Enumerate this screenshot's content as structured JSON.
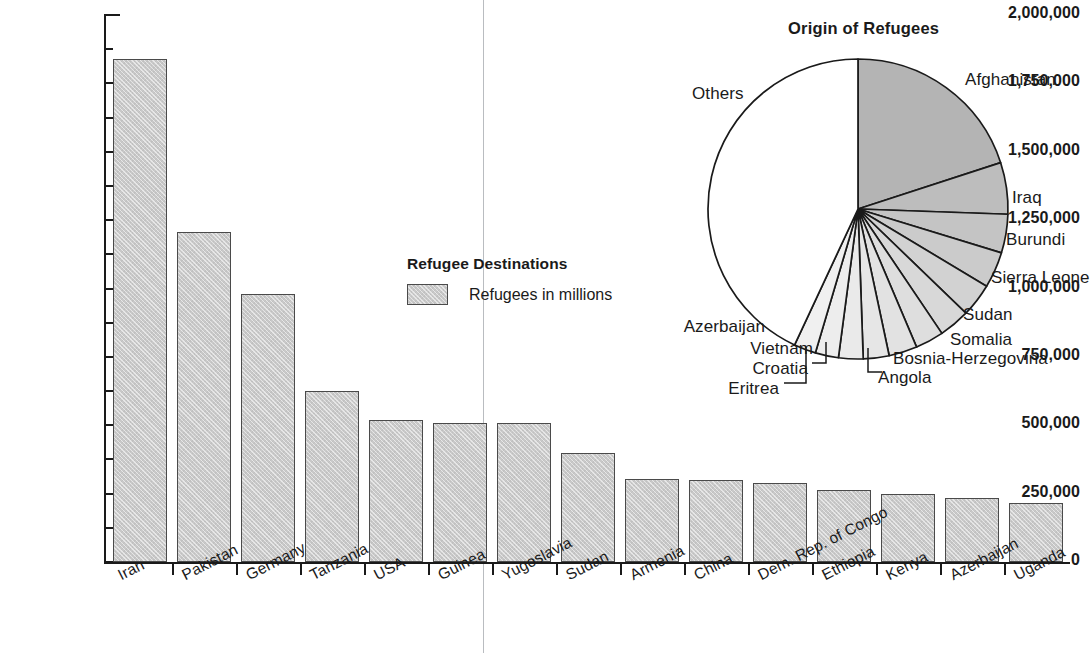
{
  "chart_data": [
    {
      "type": "bar",
      "title": "Refugee Destinations",
      "legend_title": "Refugee Destinations",
      "legend_entry": "Refugees in millions",
      "legend_position": "center",
      "xlabel": "",
      "ylabel": "",
      "ylim": [
        0,
        2000000
      ],
      "ytick_step": 250000,
      "grid": false,
      "orientation": "vertical",
      "categories": [
        "Iran",
        "Pakistan",
        "Germany",
        "Tanzania",
        "USA",
        "Guinea",
        "Yugoslavia",
        "Sudan",
        "Armenia",
        "China",
        "Dem. Rep. of Congo",
        "Ethiopia",
        "Kenya",
        "Azerbaijan",
        "Uganda"
      ],
      "values": [
        1840000,
        1205000,
        980000,
        625000,
        520000,
        510000,
        508000,
        398000,
        302000,
        300000,
        290000,
        265000,
        248000,
        233000,
        215000
      ],
      "ytick_labels": [
        "0",
        "250,000",
        "500,000",
        "750,000",
        "1,000,000",
        "1,250,000",
        "1,500,000",
        "1,750,000",
        "2,000,000"
      ],
      "ytick_values": [
        0,
        250000,
        500000,
        750000,
        1000000,
        1250000,
        1500000,
        1750000,
        2000000
      ],
      "series_color": "#c9c9c9",
      "series_edge_color": "#4a4a4a"
    },
    {
      "type": "pie",
      "title": "Origin of Refugees",
      "start_angle_deg": 0,
      "direction": "clockwise",
      "labels": [
        "Afghanistan",
        "Iraq",
        "Burundi",
        "Sierra Leone",
        "Sudan",
        "Somalia",
        "Bosnia-Herzegovina",
        "Angola",
        "Eritrea",
        "Croatia",
        "Vietnam",
        "Azerbaijan",
        "Others"
      ],
      "values": [
        20.0,
        5.6,
        4.2,
        3.9,
        3.6,
        3.3,
        3.1,
        3.1,
        2.8,
        2.6,
        2.5,
        2.4,
        42.9
      ],
      "slice_angles_deg": [
        72,
        20,
        15,
        14,
        13,
        12,
        11,
        11,
        10,
        9.5,
        9,
        8.5,
        155
      ],
      "slice_colors": [
        "#b4b4b4",
        "#bdbdbd",
        "#c4c4c4",
        "#cbcbcb",
        "#d2d2d2",
        "#d8d8d8",
        "#dedede",
        "#e2e2e2",
        "#e6e6e6",
        "#eaeaea",
        "#ededed",
        "#f0f0f0",
        "#ffffff"
      ],
      "callout_labels": [
        "Croatia",
        "Eritrea",
        "Angola"
      ]
    }
  ],
  "bar_chart": {
    "legend": {
      "title": "Refugee Destinations",
      "entry": "Refugees in millions"
    },
    "y_ticks": [
      {
        "label": "2,000,000",
        "value": 2000000
      },
      {
        "label": "1,750,000",
        "value": 1750000
      },
      {
        "label": "1,500,000",
        "value": 1500000
      },
      {
        "label": "1,250,000",
        "value": 1250000
      },
      {
        "label": "1,000,000",
        "value": 1000000
      },
      {
        "label": "750,000",
        "value": 750000
      },
      {
        "label": "500,000",
        "value": 500000
      },
      {
        "label": "250,000",
        "value": 250000
      },
      {
        "label": "0",
        "value": 0
      }
    ],
    "bars": [
      {
        "label": "Iran",
        "value": 1840000
      },
      {
        "label": "Pakistan",
        "value": 1205000
      },
      {
        "label": "Germany",
        "value": 980000
      },
      {
        "label": "Tanzania",
        "value": 625000
      },
      {
        "label": "USA",
        "value": 520000
      },
      {
        "label": "Guinea",
        "value": 510000
      },
      {
        "label": "Yugoslavia",
        "value": 508000
      },
      {
        "label": "Sudan",
        "value": 398000
      },
      {
        "label": "Armenia",
        "value": 302000
      },
      {
        "label": "China",
        "value": 300000
      },
      {
        "label": "Dem. Rep. of Congo",
        "value": 290000
      },
      {
        "label": "Ethiopia",
        "value": 265000
      },
      {
        "label": "Kenya",
        "value": 248000
      },
      {
        "label": "Azerbaijan",
        "value": 233000
      },
      {
        "label": "Uganda",
        "value": 215000
      }
    ]
  },
  "pie_chart": {
    "title": "Origin of Refugees",
    "slices": [
      {
        "label": "Afghanistan",
        "angle": 72,
        "color": "#b4b4b4",
        "lx": 965,
        "ly": 70,
        "anchor": "left"
      },
      {
        "label": "Iraq",
        "angle": 20,
        "color": "#bdbdbd",
        "lx": 1012,
        "ly": 188,
        "anchor": "left"
      },
      {
        "label": "Burundi",
        "angle": 15,
        "color": "#c4c4c4",
        "lx": 1006,
        "ly": 230,
        "anchor": "left"
      },
      {
        "label": "Sierra Leone",
        "angle": 14,
        "color": "#cbcbcb",
        "lx": 991,
        "ly": 268,
        "anchor": "left"
      },
      {
        "label": "Sudan",
        "angle": 13,
        "color": "#d2d2d2",
        "lx": 963,
        "ly": 305,
        "anchor": "left"
      },
      {
        "label": "Somalia",
        "angle": 12,
        "color": "#d8d8d8",
        "lx": 950,
        "ly": 330,
        "anchor": "left"
      },
      {
        "label": "Bosnia-Herzegovina",
        "angle": 11,
        "color": "#dedede",
        "lx": 893,
        "ly": 349,
        "anchor": "left"
      },
      {
        "label": "Angola",
        "angle": 11,
        "color": "#e2e2e2",
        "lx": 878,
        "ly": 368,
        "anchor": "left"
      },
      {
        "label": "Eritrea",
        "angle": 10,
        "color": "#e6e6e6",
        "lx": 779,
        "ly": 379,
        "anchor": "right"
      },
      {
        "label": "Croatia",
        "angle": 9.5,
        "color": "#eaeaea",
        "lx": 808,
        "ly": 359,
        "anchor": "right"
      },
      {
        "label": "Vietnam",
        "angle": 9,
        "color": "#ededed",
        "lx": 813,
        "ly": 339,
        "anchor": "right"
      },
      {
        "label": "Azerbaijan",
        "angle": 8.5,
        "color": "#f0f0f0",
        "lx": 765,
        "ly": 317,
        "anchor": "right"
      },
      {
        "label": "Others",
        "angle": 155,
        "color": "#ffffff",
        "lx": 692,
        "ly": 84,
        "anchor": "left"
      }
    ]
  }
}
